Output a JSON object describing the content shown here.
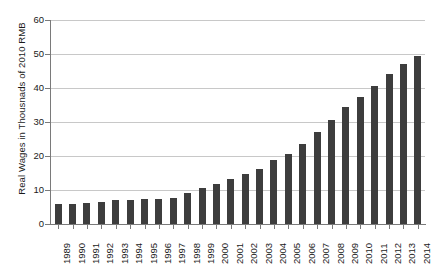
{
  "chart_data": {
    "type": "bar",
    "title": "",
    "xlabel": "",
    "ylabel": "Real Wages in Thousnads of 2010 RMB",
    "ylim": [
      0,
      60
    ],
    "ytick_labels": [
      "0",
      "10",
      "20",
      "30",
      "40",
      "50",
      "60"
    ],
    "ytick_values": [
      0,
      10,
      20,
      30,
      40,
      50,
      60
    ],
    "grid": "horizontal",
    "legend": "none",
    "bar_color": "#3d3d3d",
    "gridline_color": "#c8c8c8",
    "axis_color": "#7a7a7a",
    "categories": [
      "1989",
      "1990",
      "1991",
      "1992",
      "1993",
      "1994",
      "1995",
      "1996",
      "1997",
      "1998",
      "1999",
      "2000",
      "2001",
      "2002",
      "2003",
      "2004",
      "2005",
      "2006",
      "2007",
      "2008",
      "2009",
      "2010",
      "2011",
      "2012",
      "2013",
      "2014"
    ],
    "values": [
      5.8,
      6.0,
      6.3,
      6.6,
      7.0,
      7.1,
      7.3,
      7.5,
      7.6,
      9.0,
      10.7,
      11.7,
      13.2,
      14.7,
      16.3,
      18.7,
      20.7,
      23.5,
      27.0,
      30.5,
      34.5,
      37.5,
      40.5,
      44.0,
      47.0,
      49.5
    ],
    "series": [
      {
        "name": "Real Wages",
        "values": [
          5.8,
          6.0,
          6.3,
          6.6,
          7.0,
          7.1,
          7.3,
          7.5,
          7.6,
          9.0,
          10.7,
          11.7,
          13.2,
          14.7,
          16.3,
          18.7,
          20.7,
          23.5,
          27.0,
          30.5,
          34.5,
          37.5,
          40.5,
          44.0,
          47.0,
          49.5
        ]
      }
    ]
  }
}
